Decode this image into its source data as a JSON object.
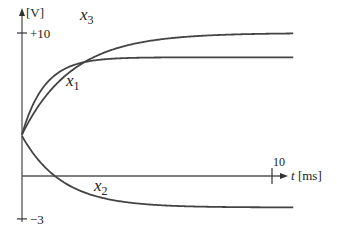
{
  "chart_data": {
    "type": "line",
    "title": "",
    "xlabel": "t [ms]",
    "ylabel": "[V]",
    "xlim": [
      0,
      11.2
    ],
    "ylim": [
      -3,
      10
    ],
    "x_ticks": [
      {
        "value": 10,
        "label": "10"
      }
    ],
    "y_ticks": [
      {
        "value": 10,
        "label": "+10"
      },
      {
        "value": -3,
        "label": "−3"
      }
    ],
    "grid": false,
    "series": [
      {
        "name": "x3",
        "label_main": "x",
        "label_sub": "3",
        "start": 2.9,
        "final": 10.0,
        "tau": 2.0
      },
      {
        "name": "x1",
        "label_main": "x",
        "label_sub": "1",
        "start": 2.9,
        "final": 8.3,
        "tau": 0.9
      },
      {
        "name": "x2",
        "label_main": "x",
        "label_sub": "2",
        "start": 2.8,
        "final": -2.2,
        "tau": 1.6
      }
    ]
  }
}
